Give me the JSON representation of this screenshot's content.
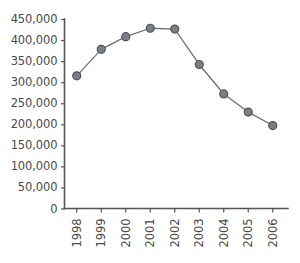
{
  "chart_data": {
    "type": "line",
    "title": "",
    "subtitle": "",
    "xlabel": "",
    "ylabel": "",
    "categories": [
      "1998",
      "1999",
      "2000",
      "2001",
      "2002",
      "2003",
      "2004",
      "2005",
      "2006"
    ],
    "values": [
      315000,
      378000,
      408000,
      428000,
      426000,
      342000,
      272000,
      229000,
      197000
    ],
    "series": [
      {
        "name": "",
        "values": [
          315000,
          378000,
          408000,
          428000,
          426000,
          342000,
          272000,
          229000,
          197000
        ]
      }
    ],
    "ylim": [
      0,
      450000
    ],
    "y_ticks": [
      0,
      50000,
      100000,
      150000,
      200000,
      250000,
      300000,
      350000,
      400000,
      450000
    ],
    "y_tick_labels": [
      "0",
      "50,000",
      "100,000",
      "150,000",
      "200,000",
      "250,000",
      "300,000",
      "350,000",
      "400,000",
      "450,000"
    ],
    "x_tick_labels": [
      "1998",
      "1999",
      "2000",
      "2001",
      "2002",
      "2003",
      "2004",
      "2005",
      "2006"
    ],
    "x_tick_rotation": -90,
    "grid": false,
    "legend": false,
    "legend_position": "none",
    "marker": "circle",
    "line_color": "#6f6f6f",
    "marker_fill_color": "#7a7f85",
    "marker_edge_color": "#4f5359",
    "axis_color": "#555555",
    "background_color": "#ffffff"
  }
}
